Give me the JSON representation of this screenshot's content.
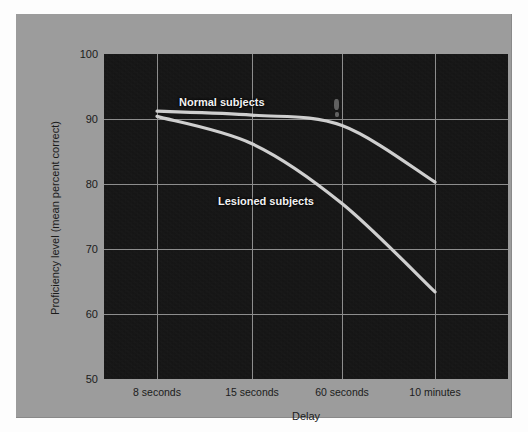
{
  "figure": {
    "background_color": "#fdfdfd",
    "panel_color": "#9c9c9c",
    "plot_background_color": "#141414",
    "grid_color": "#8d8d8d",
    "line_color": "#c9c9c9",
    "label_color": "#f2f2f2"
  },
  "chart_data": {
    "type": "line",
    "title": "",
    "xlabel": "Delay",
    "ylabel": "Proficiency level (mean percent correct)",
    "categories": [
      "8 seconds",
      "15 seconds",
      "60 seconds",
      "10 minutes"
    ],
    "x_tick_labels": [
      "8 seconds",
      "15 seconds",
      "60 seconds",
      "10 minutes"
    ],
    "y_tick_labels": [
      "100",
      "90",
      "80",
      "70",
      "60",
      "50"
    ],
    "y_ticks": [
      100,
      90,
      80,
      70,
      60,
      50
    ],
    "ylim": [
      50,
      100
    ],
    "grid": true,
    "grid_axes": "both",
    "legend": "inline-annotations",
    "series": [
      {
        "name": "Normal subjects",
        "values": [
          91.2,
          90.6,
          89.0,
          80.3
        ],
        "label": "Normal subjects"
      },
      {
        "name": "Lesioned subjects",
        "values": [
          90.4,
          86.2,
          77.0,
          63.4
        ],
        "label": "Lesioned subjects"
      }
    ]
  },
  "annotations": {
    "normal": "Normal subjects",
    "lesioned": "Lesioned subjects"
  },
  "axes": {
    "y_title": "Proficiency level (mean percent correct)",
    "x_title": "Delay",
    "y_ticks": [
      "100",
      "90",
      "80",
      "70",
      "60",
      "50"
    ],
    "x_ticks": [
      "8 seconds",
      "15 seconds",
      "60 seconds",
      "10 minutes"
    ]
  }
}
